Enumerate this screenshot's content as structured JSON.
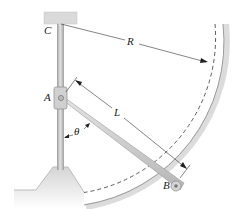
{
  "figure": {
    "type": "mechanism-diagram",
    "colors": {
      "background": "#ffffff",
      "rod": "#c8c8c8",
      "rod_edge": "#8a8a8a",
      "support": "#d9d9d9",
      "track": "#dcdcdc",
      "dim_line": "#333333",
      "dashed_arc": "#333333"
    }
  },
  "labels": {
    "C": "C",
    "A": "A",
    "B": "B",
    "L": "L",
    "R": "R",
    "theta": "θ"
  }
}
